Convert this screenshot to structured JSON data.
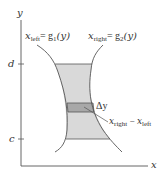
{
  "figure": {
    "axes": {
      "x_label": "x",
      "y_label": "y",
      "y_ticks": [
        {
          "label": "d",
          "y": 64
        },
        {
          "label": "c",
          "y": 139
        }
      ]
    },
    "curves": {
      "left": {
        "name": "x",
        "sub": "left",
        "eq": "= g",
        "eq_sub": "1",
        "arg": "(y)"
      },
      "right": {
        "name": "x",
        "sub": "right",
        "eq": "= g",
        "eq_sub": "2",
        "arg": "(y)"
      }
    },
    "strip": {
      "delta_label": "Δy",
      "width_label": {
        "a": "x",
        "a_sub": "right",
        "op": " − ",
        "b": "x",
        "b_sub": "left"
      }
    },
    "colors": {
      "region_fill": "#d9d9d9",
      "strip_fill": "#a8a8a8",
      "line": "#555555"
    }
  }
}
